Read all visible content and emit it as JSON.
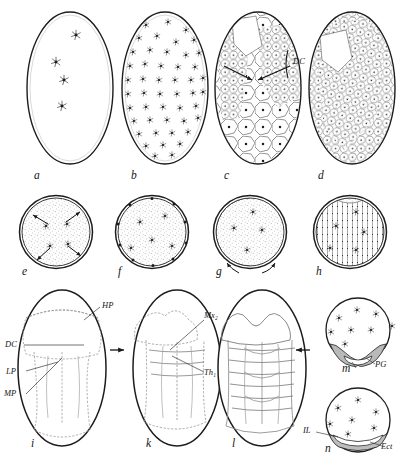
{
  "figure": {
    "panel_count": 14,
    "background_color": "#ffffff",
    "ink_color": "#1a1a1a"
  },
  "panels": [
    {
      "id": "a",
      "letter": "a",
      "row": 1,
      "shape": "egg",
      "cx": 70,
      "cy": 88,
      "rx": 43,
      "ry": 76,
      "letter_x": 34,
      "letter_y": 176,
      "description": "Egg with four cleavage nuclei in central column",
      "nuclei": [
        [
          76,
          35
        ],
        [
          56,
          62
        ],
        [
          64,
          80
        ],
        [
          62,
          106
        ]
      ],
      "nuclei_count": 4,
      "stipple": "none"
    },
    {
      "id": "b",
      "letter": "b",
      "row": 1,
      "shape": "egg",
      "cx": 165,
      "cy": 88,
      "rx": 43,
      "ry": 76,
      "letter_x": 131,
      "letter_y": 176,
      "description": "Egg filled with many energid nuclei spreading through yolk",
      "nuclei_count": 62,
      "stipple": "none"
    },
    {
      "id": "c",
      "letter": "c",
      "row": 1,
      "shape": "egg",
      "cx": 258,
      "cy": 88,
      "rx": 43,
      "ry": 76,
      "letter_x": 224,
      "letter_y": 176,
      "description": "Egg with large polygonal yolk cells and a denser cell field; converging arrows mark germ disc",
      "cell_mosaic": "coarse",
      "arrows": 2
    },
    {
      "id": "d",
      "letter": "d",
      "row": 1,
      "shape": "egg",
      "cx": 352,
      "cy": 88,
      "rx": 43,
      "ry": 76,
      "letter_x": 318,
      "letter_y": 176,
      "description": "Egg with dense cellular blastoderm mosaic, germ disc condensed",
      "cell_mosaic": "fine"
    },
    {
      "id": "e",
      "letter": "e",
      "row": 2,
      "shape": "circle",
      "cx": 56,
      "cy": 232,
      "rx": 36,
      "ry": 36,
      "letter_x": 22,
      "letter_y": 273,
      "description": "Cross-section: nuclei migrating outward to periphery, radiating arrows",
      "nuclei_count": 4,
      "arrows": 4,
      "stipple": "yolk"
    },
    {
      "id": "f",
      "letter": "f",
      "row": 2,
      "shape": "circle",
      "cx": 152,
      "cy": 232,
      "rx": 36,
      "ry": 36,
      "letter_x": 118,
      "letter_y": 273,
      "description": "Cross-section: nuclei reached cortex, vitellophages remain central",
      "nuclei_count": 5,
      "stipple": "yolk"
    },
    {
      "id": "g",
      "letter": "g",
      "row": 2,
      "shape": "circle",
      "cx": 250,
      "cy": 232,
      "rx": 36,
      "ry": 36,
      "letter_x": 216,
      "letter_y": 273,
      "description": "Cross-section: blastoderm forming over ventral half, arrows show spreading",
      "nuclei_count": 4,
      "arrows": 2,
      "stipple": "yolk"
    },
    {
      "id": "h",
      "letter": "h",
      "row": 2,
      "shape": "circle",
      "cx": 350,
      "cy": 232,
      "rx": 36,
      "ry": 36,
      "letter_x": 316,
      "letter_y": 273,
      "description": "Cross-section: complete cellular blastoderm ring enclosing yolk",
      "nuclei_count": 5,
      "stipple": "yolk"
    },
    {
      "id": "i",
      "letter": "i",
      "row": 3,
      "shape": "egg",
      "cx": 62,
      "cy": 368,
      "rx": 44,
      "ry": 78,
      "letter_x": 31,
      "letter_y": 447,
      "description": "Germ band with head lobes; labelled HP, DC, LP, MP"
    },
    {
      "id": "k",
      "letter": "k",
      "row": 3,
      "shape": "egg",
      "cx": 177,
      "cy": 368,
      "rx": 44,
      "ry": 78,
      "letter_x": 146,
      "letter_y": 447,
      "description": "Segmented germ band; labelled Mx2 and Th1, lateral arrow marks section level"
    },
    {
      "id": "l",
      "letter": "l",
      "row": 3,
      "shape": "egg",
      "cx": 262,
      "cy": 368,
      "rx": 44,
      "ry": 78,
      "letter_x": 232,
      "letter_y": 447,
      "description": "Further segmented germ band with many metameres, lateral arrow marks section level"
    },
    {
      "id": "m",
      "letter": "m",
      "row": 3,
      "shape": "circle",
      "cx": 358,
      "cy": 330,
      "rx": 33,
      "ry": 32,
      "letter_x": 342,
      "letter_y": 371,
      "description": "Transverse section through germ band: paired ventral plates labelled PG",
      "nuclei_count": 8
    },
    {
      "id": "n",
      "letter": "n",
      "row": 3,
      "shape": "circle",
      "cx": 358,
      "cy": 420,
      "rx": 33,
      "ry": 32,
      "letter_x": 325,
      "letter_y": 452,
      "description": "Transverse section: inner layer (IL) beneath ectoderm (Ect)",
      "nuclei_count": 7
    }
  ],
  "annotations": [
    {
      "id": "DC-top",
      "text": "DC",
      "x": 293,
      "y": 62,
      "panel": "c",
      "meaning": "germ disc / differentiation centre"
    },
    {
      "id": "HP",
      "text": "HP",
      "x": 104,
      "y": 306,
      "panel": "i",
      "meaning": "head plate"
    },
    {
      "id": "DC-i",
      "text": "DC",
      "x": 6,
      "y": 346,
      "panel": "i",
      "meaning": "differentiation centre"
    },
    {
      "id": "LP",
      "text": "LP",
      "x": 7,
      "y": 374,
      "panel": "i",
      "meaning": "lateral plate"
    },
    {
      "id": "MP",
      "text": "MP",
      "x": 5,
      "y": 396,
      "panel": "i",
      "meaning": "median plate"
    },
    {
      "id": "Mx2",
      "text": "Mx₂",
      "x": 205,
      "y": 316,
      "panel": "k",
      "meaning": "second maxillary segment"
    },
    {
      "id": "Th1",
      "text": "Th₁",
      "x": 205,
      "y": 374,
      "panel": "k",
      "meaning": "first thoracic segment"
    },
    {
      "id": "PG",
      "text": "PG",
      "x": 377,
      "y": 366,
      "panel": "m",
      "meaning": "primitive groove plates"
    },
    {
      "id": "IL",
      "text": "IL",
      "x": 305,
      "y": 432,
      "panel": "n",
      "meaning": "inner layer"
    },
    {
      "id": "Ect",
      "text": "Ect",
      "x": 383,
      "y": 448,
      "panel": "n",
      "meaning": "ectoderm"
    }
  ],
  "section_arrows": [
    {
      "id": "arrow-left-k",
      "x": 116,
      "y": 350,
      "direction": "right"
    },
    {
      "id": "arrow-right-l",
      "x": 302,
      "y": 350,
      "direction": "left"
    }
  ]
}
